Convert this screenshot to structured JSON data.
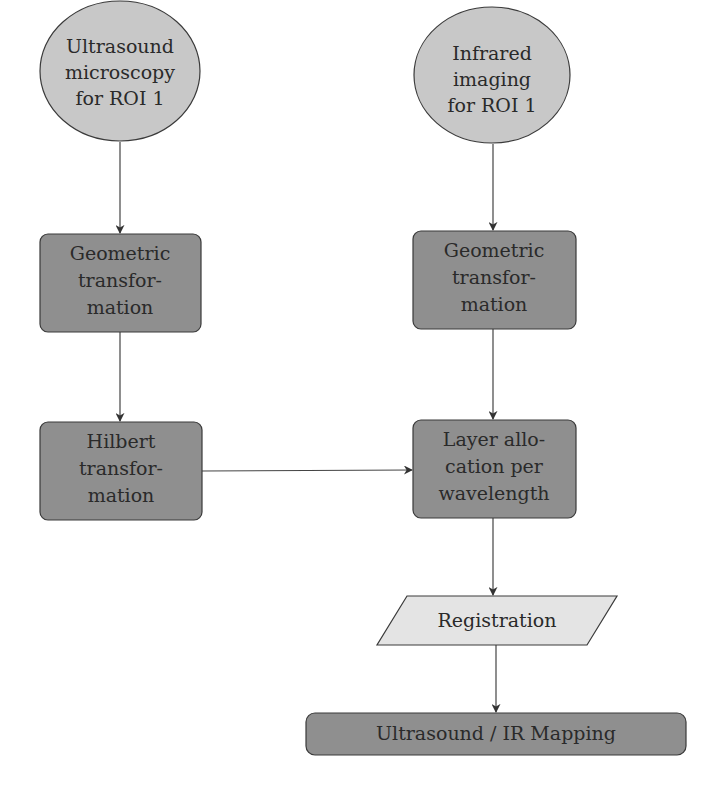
{
  "colors": {
    "start_fill": "#c8c8c8",
    "process_fill": "#8f8f8f",
    "io_fill": "#e4e4e4",
    "stroke": "#3a3a3a",
    "text": "#2a2a2a",
    "background": "#ffffff"
  },
  "nodes": {
    "us_start": {
      "shape": "ellipse",
      "lines": [
        "Ultrasound",
        "microscopy",
        "for ROI 1"
      ]
    },
    "ir_start": {
      "shape": "ellipse",
      "lines": [
        "Infrared",
        "imaging",
        "for ROI 1"
      ]
    },
    "us_geo": {
      "shape": "rounded-rect",
      "lines": [
        "Geometric",
        "transfor-",
        "mation"
      ]
    },
    "ir_geo": {
      "shape": "rounded-rect",
      "lines": [
        "Geometric",
        "transfor-",
        "mation"
      ]
    },
    "hilbert": {
      "shape": "rounded-rect",
      "lines": [
        "Hilbert",
        "transfor-",
        "mation"
      ]
    },
    "layer": {
      "shape": "rounded-rect",
      "lines": [
        "Layer allo-",
        "cation per",
        "wavelength"
      ]
    },
    "registration": {
      "shape": "parallelogram",
      "lines": [
        "Registration"
      ]
    },
    "mapping": {
      "shape": "rounded-rect",
      "lines": [
        "Ultrasound / IR Mapping"
      ]
    }
  },
  "edges": [
    {
      "from": "us_start",
      "to": "us_geo"
    },
    {
      "from": "us_geo",
      "to": "hilbert"
    },
    {
      "from": "hilbert",
      "to": "layer"
    },
    {
      "from": "ir_start",
      "to": "ir_geo"
    },
    {
      "from": "ir_geo",
      "to": "layer"
    },
    {
      "from": "layer",
      "to": "registration"
    },
    {
      "from": "registration",
      "to": "mapping"
    }
  ]
}
